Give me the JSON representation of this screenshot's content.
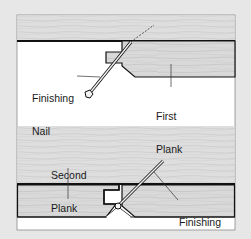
{
  "figure": {
    "top_diagram": {
      "labels": {
        "nail_line1": "Finishing",
        "nail_line2": "Nail",
        "plank_line1": "First",
        "plank_line2": "Plank"
      }
    },
    "bottom_diagram": {
      "labels": {
        "plank_line1": "Second",
        "plank_line2": "Plank",
        "nail_line1": "Finishing",
        "nail_line2": "Nail"
      }
    }
  },
  "colors": {
    "page_background": "#e7e7e7",
    "panel_background": "#ffffff",
    "wood_light": "#dcdcdc",
    "wood_grain": "#c4c4c4",
    "outline": "#111111",
    "nail_fill": "#f2f2f2"
  }
}
